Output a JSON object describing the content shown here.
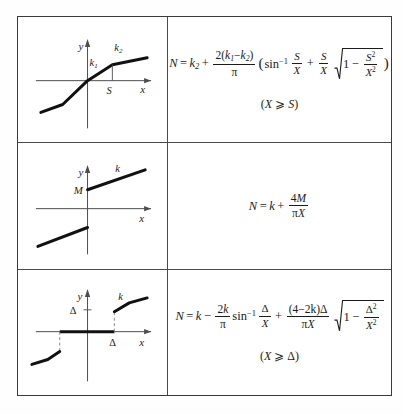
{
  "document": {
    "title": "Describing-function table for three nonlinearities",
    "type": "table"
  },
  "table": {
    "column_roles": [
      "nonlinearity-graph",
      "describing-function-formula"
    ],
    "rows": [
      {
        "id": "row-1",
        "graph": {
          "name": "saturation-type-piecewise-linear-characteristic",
          "y_axis_label": "y",
          "x_axis_label": "x",
          "slope_labels": [
            "k₁",
            "k₂"
          ],
          "k1": "k",
          "k1_sub": "1",
          "k2": "k",
          "k2_sub": "2",
          "breakpoint_label": "S",
          "curve_description": "Central segment of steep slope k1 between -S and +S, outer segments of shallower slope k2"
        },
        "formula": {
          "N": "N",
          "eq": "=",
          "k_main": "k",
          "k_main_sub": "2",
          "plus": "+",
          "frac_num_prefix": "2(",
          "frac_num_k1": "k",
          "frac_num_k1_sub": "1",
          "frac_num_minus": "−",
          "frac_num_k2": "k",
          "frac_num_k2_sub": "2",
          "frac_num_suffix": ")",
          "frac_den": "π",
          "open_paren": "(",
          "arcsin": "sin",
          "arcsin_sup": "−1",
          "ratio_num": "S",
          "ratio_den": "X",
          "inner_plus": "+",
          "ratio2_num": "S",
          "ratio2_den": "X",
          "sqrt_one": "1",
          "sqrt_minus": "−",
          "sqrt_num": "S",
          "sqrt_num_sup": "2",
          "sqrt_den": "X",
          "sqrt_den_sup": "2",
          "close_paren": ")"
        },
        "condition": {
          "open": "(",
          "X": "X",
          "rel": "⩾",
          "value": "S",
          "close": ")"
        }
      },
      {
        "id": "row-2",
        "graph": {
          "name": "coulomb-friction-plus-linear-characteristic",
          "y_axis_label": "y",
          "x_axis_label": "x",
          "slope_label": "k",
          "offset_label": "M",
          "curve_description": "Two parallel lines of slope k offset by +M above origin and -M below origin"
        },
        "formula": {
          "N": "N",
          "eq": "=",
          "k_main": "k",
          "plus": "+",
          "frac_num_coef": "4",
          "frac_num_M": "M",
          "frac_den_pi": "π",
          "frac_den_X": "X"
        },
        "condition": null
      },
      {
        "id": "row-3",
        "graph": {
          "name": "dead-zone-with-jump-characteristic",
          "y_axis_label": "y",
          "x_axis_label": "x",
          "slope_label": "k",
          "y_tick_label": "Δ",
          "x_tick_label": "Δ",
          "curve_description": "Zero output dead band between -Δ and +Δ, then jump discontinuity to sloped segments of slope k"
        },
        "formula": {
          "N": "N",
          "eq": "=",
          "k_main": "k",
          "minus": "−",
          "frac1_num_coef": "2",
          "frac1_num_k": "k",
          "frac1_den": "π",
          "arcsin": "sin",
          "arcsin_sup": "−1",
          "ratio_num": "Δ",
          "ratio_den": "X",
          "plus": "+",
          "frac2_num": "(4−2k)Δ",
          "frac2_den_pi": "π",
          "frac2_den_X": "X",
          "sqrt_one": "1",
          "sqrt_minus": "−",
          "sqrt_num": "Δ",
          "sqrt_num_sup": "2",
          "sqrt_den": "X",
          "sqrt_den_sup": "2"
        },
        "condition": {
          "open": "(",
          "X": "X",
          "rel": "⩾",
          "value": "Δ",
          "close": ")"
        }
      }
    ]
  },
  "colors": {
    "page_background": "#ffffff",
    "frame_border": "#3a3a3a",
    "divider": "#4a4a4a",
    "ink": "#1b1b1b",
    "curve": "#111111",
    "axis": "#4d4d4d"
  }
}
